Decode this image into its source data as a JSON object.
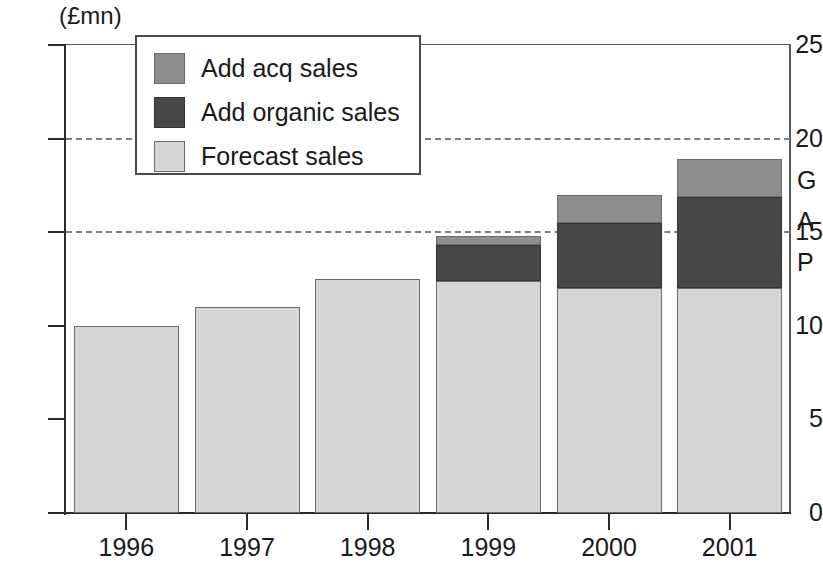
{
  "chart_data": {
    "type": "bar",
    "stacked": true,
    "title": "",
    "subtitle": "",
    "xlabel": "",
    "ylabel": "(£mn)",
    "unit_label": "(£mn)",
    "categories": [
      "1996",
      "1997",
      "1998",
      "1999",
      "2000",
      "2001"
    ],
    "series": [
      {
        "name": "Forecast sales",
        "values": [
          10.0,
          11.0,
          12.5,
          12.4,
          12.0,
          12.0
        ]
      },
      {
        "name": "Add organic sales",
        "values": [
          0,
          0,
          0,
          1.9,
          3.5,
          4.9
        ]
      },
      {
        "name": "Add acq sales",
        "values": [
          0,
          0,
          0,
          0.5,
          1.5,
          2.0
        ]
      }
    ],
    "totals": [
      10.0,
      11.0,
      12.5,
      14.8,
      17.0,
      18.9
    ],
    "ylim": [
      0,
      25
    ],
    "yticks": [
      0,
      5,
      10,
      15,
      20,
      25
    ],
    "ytick_labels": [
      "0",
      "5",
      "10",
      "15",
      "20",
      "25"
    ],
    "gridlines_at": [
      15,
      20
    ],
    "grid": "dashed-horizontal",
    "legend_position": "top-left-inside",
    "annotations": [
      "G",
      "A",
      "P"
    ]
  },
  "legend": {
    "items": [
      {
        "label": "Add acq sales",
        "color": "#8d8d8d",
        "swatch": "acq-swatch"
      },
      {
        "label": "Add organic sales",
        "color": "#474747",
        "swatch": "organic-swatch"
      },
      {
        "label": "Forecast sales",
        "color": "#d6d6d6",
        "swatch": "forecast-swatch"
      }
    ]
  },
  "annotation": {
    "letters": [
      "G",
      "A",
      "P"
    ]
  },
  "colors": {
    "forecast": "#d6d6d6",
    "organic": "#474747",
    "acq": "#8d8d8d",
    "axis": "#2a2a2a",
    "grid": "#7d7d7d",
    "background": "#ffffff",
    "text": "#1a1a1a"
  }
}
